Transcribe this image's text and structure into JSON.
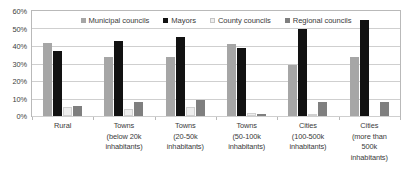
{
  "chart_data": {
    "type": "bar",
    "title": "",
    "xlabel": "",
    "ylabel": "",
    "ylim": [
      0,
      60
    ],
    "ytick_labels": [
      "60%",
      "50%",
      "40%",
      "30%",
      "20%",
      "10%",
      "0%"
    ],
    "ytick_values": [
      60,
      50,
      40,
      30,
      20,
      10,
      0
    ],
    "grid": true,
    "legend_position": "top-center",
    "categories": [
      "Rural",
      "Towns (below 20k inhabitants)",
      "Towns (20-50k inhabitants)",
      "Towns (50-100k inhabitants)",
      "Cities (100-500k inhabitants)",
      "Cities (more than 500k inhabitants)"
    ],
    "category_lines": [
      [
        "Rural"
      ],
      [
        "Towns",
        "(below 20k",
        "inhabitants)"
      ],
      [
        "Towns",
        "(20-50k",
        "inhabitants)"
      ],
      [
        "Towns",
        "(50-100k",
        "inhabitants)"
      ],
      [
        "Cities",
        "(100-500k",
        "inhabitants)"
      ],
      [
        "Cities",
        "(more than",
        "500k",
        "inhabitants)"
      ]
    ],
    "series": [
      {
        "name": "Municipal councils",
        "color": "#a6a6a6",
        "values": [
          42,
          34,
          34,
          41,
          29,
          34
        ]
      },
      {
        "name": "Mayors",
        "color": "#121212",
        "values": [
          37,
          43,
          45,
          39,
          50,
          55
        ]
      },
      {
        "name": "County councils",
        "color": "#eeeeee",
        "values": [
          5,
          4,
          5,
          2,
          1,
          0
        ]
      },
      {
        "name": "Regional councils",
        "color": "#7f7f7f",
        "values": [
          6,
          8,
          9,
          1,
          8,
          8
        ]
      }
    ]
  }
}
